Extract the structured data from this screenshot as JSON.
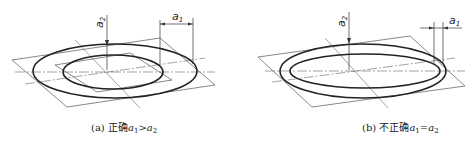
{
  "figures": [
    {
      "id": "a",
      "caption_prefix": "(a) 正确",
      "caption_expr": "a",
      "caption_sub1": "1",
      "caption_op": ">",
      "caption_expr2": "a",
      "caption_sub2": "2",
      "label_vertical": "a2",
      "label_horizontal": "a1",
      "verdict": "correct"
    },
    {
      "id": "b",
      "caption_prefix": "(b) 不正确",
      "caption_expr": "a",
      "caption_sub1": "1",
      "caption_op": "=",
      "caption_expr2": "a",
      "caption_sub2": "2",
      "label_vertical": "a2",
      "label_horizontal": "a1",
      "verdict": "incorrect"
    }
  ],
  "colors": {
    "line": "#222222",
    "thin": "#555555",
    "background": "#ffffff"
  }
}
